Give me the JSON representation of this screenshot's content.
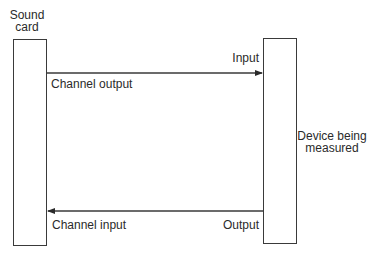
{
  "diagram": {
    "nodes": [
      {
        "id": "sound-card",
        "label_lines": [
          "Sound",
          "card"
        ]
      },
      {
        "id": "device",
        "label_lines": [
          "Device being",
          "measured"
        ]
      }
    ],
    "edges": [
      {
        "from": "sound-card",
        "to": "device",
        "from_label": "Channel output",
        "to_label": "Input",
        "direction": "right"
      },
      {
        "from": "device",
        "to": "sound-card",
        "from_label": "Output",
        "to_label": "Channel input",
        "direction": "left"
      }
    ],
    "colors": {
      "stroke": "#3a3a3a",
      "text": "#2a2a2a",
      "background": "#ffffff"
    }
  },
  "labels": {
    "sound_card_line1": "Sound",
    "sound_card_line2": "card",
    "device_line1": "Device being",
    "device_line2": "measured",
    "channel_output": "Channel output",
    "input": "Input",
    "channel_input": "Channel input",
    "output": "Output"
  }
}
